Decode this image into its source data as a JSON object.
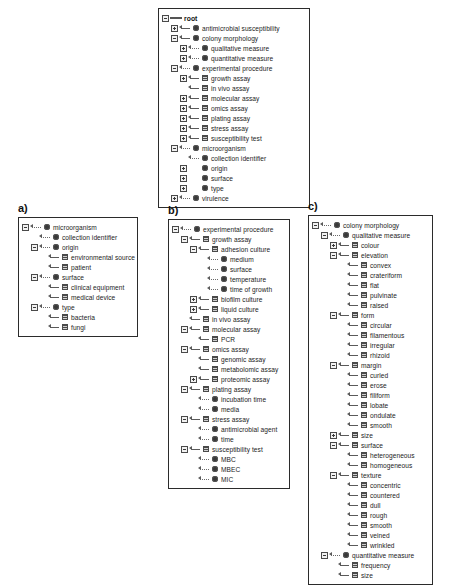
{
  "figure": {
    "panel_labels": {
      "a": "a)",
      "b": "b)",
      "c": "c)"
    }
  },
  "panels": {
    "root": {
      "name": "root-ontology-tree",
      "nodes": [
        {
          "depth": 0,
          "toggle": "minus",
          "arrow": "root",
          "glyph": "none",
          "label": "root"
        },
        {
          "depth": 1,
          "toggle": "plus",
          "arrow": "solid",
          "glyph": "circle",
          "label": "antimicrobial susceptibility"
        },
        {
          "depth": 1,
          "toggle": "minus",
          "arrow": "solid",
          "glyph": "circle",
          "label": "colony morphology"
        },
        {
          "depth": 2,
          "toggle": "plus",
          "arrow": "dotted",
          "glyph": "circle",
          "label": "qualitative measure"
        },
        {
          "depth": 2,
          "toggle": "plus",
          "arrow": "dotted",
          "glyph": "circle",
          "label": "quantitative measure"
        },
        {
          "depth": 1,
          "toggle": "minus",
          "arrow": "dotted",
          "glyph": "circle",
          "label": "experimental procedure"
        },
        {
          "depth": 2,
          "toggle": "plus",
          "arrow": "solid",
          "glyph": "square",
          "label": "growth assay"
        },
        {
          "depth": 2,
          "toggle": "none",
          "arrow": "solid",
          "glyph": "square",
          "label": "in vivo assay"
        },
        {
          "depth": 2,
          "toggle": "plus",
          "arrow": "solid",
          "glyph": "square",
          "label": "molecular assay"
        },
        {
          "depth": 2,
          "toggle": "plus",
          "arrow": "solid",
          "glyph": "square",
          "label": "omics assay"
        },
        {
          "depth": 2,
          "toggle": "plus",
          "arrow": "solid",
          "glyph": "square",
          "label": "plating assay"
        },
        {
          "depth": 2,
          "toggle": "plus",
          "arrow": "solid",
          "glyph": "square",
          "label": "stress assay"
        },
        {
          "depth": 2,
          "toggle": "plus",
          "arrow": "solid",
          "glyph": "square",
          "label": "susceptibility test"
        },
        {
          "depth": 1,
          "toggle": "minus",
          "arrow": "dotted",
          "glyph": "circle",
          "label": "microorganism"
        },
        {
          "depth": 2,
          "toggle": "none",
          "arrow": "dotted",
          "glyph": "circle",
          "label": "collection identifier"
        },
        {
          "depth": 2,
          "toggle": "plus",
          "arrow": "blank",
          "glyph": "circle",
          "label": "origin"
        },
        {
          "depth": 2,
          "toggle": "plus",
          "arrow": "blank",
          "glyph": "circle",
          "label": "surface"
        },
        {
          "depth": 2,
          "toggle": "plus",
          "arrow": "blank",
          "glyph": "circle",
          "label": "type"
        },
        {
          "depth": 1,
          "toggle": "plus",
          "arrow": "dotted",
          "glyph": "circle",
          "label": "virulence"
        }
      ]
    },
    "a": {
      "name": "microorganism-subtree",
      "nodes": [
        {
          "depth": 0,
          "toggle": "minus",
          "arrow": "dotted",
          "glyph": "circle",
          "label": "microorganism"
        },
        {
          "depth": 1,
          "toggle": "none",
          "arrow": "dotted",
          "glyph": "circle",
          "label": "collection identifier"
        },
        {
          "depth": 1,
          "toggle": "minus",
          "arrow": "dotted",
          "glyph": "circle",
          "label": "origin"
        },
        {
          "depth": 2,
          "toggle": "none",
          "arrow": "solid",
          "glyph": "square",
          "label": "environmental source"
        },
        {
          "depth": 2,
          "toggle": "none",
          "arrow": "solid",
          "glyph": "square",
          "label": "patient"
        },
        {
          "depth": 1,
          "toggle": "minus",
          "arrow": "dotted",
          "glyph": "circle",
          "label": "surface"
        },
        {
          "depth": 2,
          "toggle": "none",
          "arrow": "solid",
          "glyph": "square",
          "label": "clinical equipment"
        },
        {
          "depth": 2,
          "toggle": "none",
          "arrow": "solid",
          "glyph": "square",
          "label": "medical device"
        },
        {
          "depth": 1,
          "toggle": "minus",
          "arrow": "dotted",
          "glyph": "circle",
          "label": "type"
        },
        {
          "depth": 2,
          "toggle": "none",
          "arrow": "solid",
          "glyph": "square",
          "label": "bacteria"
        },
        {
          "depth": 2,
          "toggle": "none",
          "arrow": "solid",
          "glyph": "square",
          "label": "fungi"
        }
      ]
    },
    "b": {
      "name": "experimental-procedure-subtree",
      "nodes": [
        {
          "depth": 0,
          "toggle": "minus",
          "arrow": "dotted",
          "glyph": "circle",
          "label": "experimental procedure"
        },
        {
          "depth": 1,
          "toggle": "minus",
          "arrow": "solid",
          "glyph": "square",
          "label": "growth assay"
        },
        {
          "depth": 2,
          "toggle": "minus",
          "arrow": "solid",
          "glyph": "square",
          "label": "adhesion culture"
        },
        {
          "depth": 3,
          "toggle": "none",
          "arrow": "dotted",
          "glyph": "circle",
          "label": "medium"
        },
        {
          "depth": 3,
          "toggle": "none",
          "arrow": "dotted",
          "glyph": "circle",
          "label": "surface"
        },
        {
          "depth": 3,
          "toggle": "none",
          "arrow": "dotted",
          "glyph": "circle",
          "label": "temperature"
        },
        {
          "depth": 3,
          "toggle": "none",
          "arrow": "dotted",
          "glyph": "circle",
          "label": "time of growth"
        },
        {
          "depth": 2,
          "toggle": "plus",
          "arrow": "solid",
          "glyph": "square",
          "label": "biofilm culture"
        },
        {
          "depth": 2,
          "toggle": "plus",
          "arrow": "solid",
          "glyph": "square",
          "label": "liquid culture"
        },
        {
          "depth": 1,
          "toggle": "none",
          "arrow": "solid",
          "glyph": "square",
          "label": "in vivo assay"
        },
        {
          "depth": 1,
          "toggle": "minus",
          "arrow": "solid",
          "glyph": "square",
          "label": "molecular assay"
        },
        {
          "depth": 2,
          "toggle": "none",
          "arrow": "solid",
          "glyph": "square",
          "label": "PCR"
        },
        {
          "depth": 1,
          "toggle": "minus",
          "arrow": "solid",
          "glyph": "square",
          "label": "omics assay"
        },
        {
          "depth": 2,
          "toggle": "none",
          "arrow": "solid",
          "glyph": "square",
          "label": "genomic assay"
        },
        {
          "depth": 2,
          "toggle": "none",
          "arrow": "solid",
          "glyph": "square",
          "label": "metabolomic assay"
        },
        {
          "depth": 2,
          "toggle": "plus",
          "arrow": "solid",
          "glyph": "square",
          "label": "proteomic assay"
        },
        {
          "depth": 1,
          "toggle": "minus",
          "arrow": "solid",
          "glyph": "square",
          "label": "plating assay"
        },
        {
          "depth": 2,
          "toggle": "none",
          "arrow": "dotted",
          "glyph": "circle",
          "label": "incubation time"
        },
        {
          "depth": 2,
          "toggle": "none",
          "arrow": "dotted",
          "glyph": "circle",
          "label": "media"
        },
        {
          "depth": 1,
          "toggle": "minus",
          "arrow": "solid",
          "glyph": "square",
          "label": "stress assay"
        },
        {
          "depth": 2,
          "toggle": "none",
          "arrow": "dotted",
          "glyph": "circle",
          "label": "antimicrobial agent"
        },
        {
          "depth": 2,
          "toggle": "none",
          "arrow": "dotted",
          "glyph": "circle",
          "label": "time"
        },
        {
          "depth": 1,
          "toggle": "minus",
          "arrow": "solid",
          "glyph": "square",
          "label": "susceptibility test"
        },
        {
          "depth": 2,
          "toggle": "none",
          "arrow": "dotted",
          "glyph": "circle",
          "label": "MBC"
        },
        {
          "depth": 2,
          "toggle": "none",
          "arrow": "dotted",
          "glyph": "circle",
          "label": "MBEC"
        },
        {
          "depth": 2,
          "toggle": "none",
          "arrow": "dotted",
          "glyph": "circle",
          "label": "MIC"
        }
      ]
    },
    "c": {
      "name": "colony-morphology-subtree",
      "nodes": [
        {
          "depth": 0,
          "toggle": "minus",
          "arrow": "dotted",
          "glyph": "circle",
          "label": "colony morphology"
        },
        {
          "depth": 1,
          "toggle": "minus",
          "arrow": "dotted",
          "glyph": "circle",
          "label": "qualitative measure"
        },
        {
          "depth": 2,
          "toggle": "plus",
          "arrow": "solid",
          "glyph": "square",
          "label": "colour"
        },
        {
          "depth": 2,
          "toggle": "minus",
          "arrow": "solid",
          "glyph": "square",
          "label": "elevation"
        },
        {
          "depth": 3,
          "toggle": "none",
          "arrow": "solid",
          "glyph": "square",
          "label": "convex"
        },
        {
          "depth": 3,
          "toggle": "none",
          "arrow": "solid",
          "glyph": "square",
          "label": "crateriform"
        },
        {
          "depth": 3,
          "toggle": "none",
          "arrow": "solid",
          "glyph": "square",
          "label": "flat"
        },
        {
          "depth": 3,
          "toggle": "none",
          "arrow": "solid",
          "glyph": "square",
          "label": "pulvinate"
        },
        {
          "depth": 3,
          "toggle": "none",
          "arrow": "solid",
          "glyph": "square",
          "label": "raised"
        },
        {
          "depth": 2,
          "toggle": "minus",
          "arrow": "solid",
          "glyph": "square",
          "label": "form"
        },
        {
          "depth": 3,
          "toggle": "none",
          "arrow": "solid",
          "glyph": "square",
          "label": "circular"
        },
        {
          "depth": 3,
          "toggle": "none",
          "arrow": "solid",
          "glyph": "square",
          "label": "filamentous"
        },
        {
          "depth": 3,
          "toggle": "none",
          "arrow": "solid",
          "glyph": "square",
          "label": "irregular"
        },
        {
          "depth": 3,
          "toggle": "none",
          "arrow": "solid",
          "glyph": "square",
          "label": "rhizoid"
        },
        {
          "depth": 2,
          "toggle": "minus",
          "arrow": "solid",
          "glyph": "square",
          "label": "margin"
        },
        {
          "depth": 3,
          "toggle": "none",
          "arrow": "solid",
          "glyph": "square",
          "label": "curled"
        },
        {
          "depth": 3,
          "toggle": "none",
          "arrow": "solid",
          "glyph": "square",
          "label": "erose"
        },
        {
          "depth": 3,
          "toggle": "none",
          "arrow": "solid",
          "glyph": "square",
          "label": "filiform"
        },
        {
          "depth": 3,
          "toggle": "none",
          "arrow": "solid",
          "glyph": "square",
          "label": "lobate"
        },
        {
          "depth": 3,
          "toggle": "none",
          "arrow": "solid",
          "glyph": "square",
          "label": "ondulate"
        },
        {
          "depth": 3,
          "toggle": "none",
          "arrow": "solid",
          "glyph": "square",
          "label": "smooth"
        },
        {
          "depth": 2,
          "toggle": "plus",
          "arrow": "solid",
          "glyph": "square",
          "label": "size"
        },
        {
          "depth": 2,
          "toggle": "minus",
          "arrow": "solid",
          "glyph": "square",
          "label": "surface"
        },
        {
          "depth": 3,
          "toggle": "none",
          "arrow": "solid",
          "glyph": "square",
          "label": "heterogeneous"
        },
        {
          "depth": 3,
          "toggle": "none",
          "arrow": "solid",
          "glyph": "square",
          "label": "homogeneous"
        },
        {
          "depth": 2,
          "toggle": "minus",
          "arrow": "solid",
          "glyph": "square",
          "label": "texture"
        },
        {
          "depth": 3,
          "toggle": "none",
          "arrow": "solid",
          "glyph": "square",
          "label": "concentric"
        },
        {
          "depth": 3,
          "toggle": "none",
          "arrow": "solid",
          "glyph": "square",
          "label": "countered"
        },
        {
          "depth": 3,
          "toggle": "none",
          "arrow": "solid",
          "glyph": "square",
          "label": "dull"
        },
        {
          "depth": 3,
          "toggle": "none",
          "arrow": "solid",
          "glyph": "square",
          "label": "rough"
        },
        {
          "depth": 3,
          "toggle": "none",
          "arrow": "solid",
          "glyph": "square",
          "label": "smooth"
        },
        {
          "depth": 3,
          "toggle": "none",
          "arrow": "solid",
          "glyph": "square",
          "label": "veined"
        },
        {
          "depth": 3,
          "toggle": "none",
          "arrow": "solid",
          "glyph": "square",
          "label": "wrinkled"
        },
        {
          "depth": 1,
          "toggle": "minus",
          "arrow": "dotted",
          "glyph": "circle",
          "label": "quantitative measure"
        },
        {
          "depth": 2,
          "toggle": "none",
          "arrow": "solid",
          "glyph": "square",
          "label": "frequency"
        },
        {
          "depth": 2,
          "toggle": "none",
          "arrow": "solid",
          "glyph": "square",
          "label": "size"
        }
      ]
    }
  }
}
